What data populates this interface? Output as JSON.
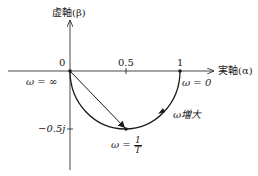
{
  "diagram": {
    "type": "nyquist-plot",
    "axes": {
      "imag_label": "虚軸(β)",
      "real_label": "実軸(α)"
    },
    "ticks": {
      "origin": "0",
      "half": "0.5",
      "one": "1",
      "imag_minus_half": "−0.5j"
    },
    "annotations": {
      "omega_infinity": "ω = ∞",
      "omega_zero": "ω = 0",
      "omega_increase": "ω増大",
      "omega_corner_prefix": "ω = ",
      "omega_corner_num": "1",
      "omega_corner_den": "T"
    },
    "colors": {
      "stroke": "#1a1a1a",
      "background": "#ffffff"
    }
  }
}
